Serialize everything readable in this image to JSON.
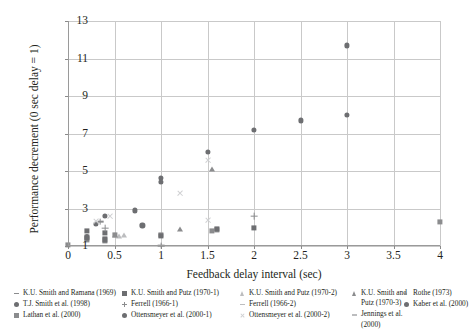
{
  "chart_data": {
    "type": "scatter",
    "title": "",
    "xlabel": "Feedback delay interval (sec)",
    "ylabel": "Performance decrement (0 sec delay = 1)",
    "xlim": [
      0,
      4
    ],
    "ylim": [
      1,
      13
    ],
    "xticks": [
      0,
      0.5,
      1,
      1.5,
      2,
      2.5,
      3,
      3.5,
      4
    ],
    "xticklabels": [
      "0",
      "0.5",
      "1",
      "1.5",
      "2",
      "2.5",
      "3",
      "3.5",
      "4"
    ],
    "yticks": [
      1,
      3,
      5,
      7,
      9,
      11,
      13
    ],
    "yticklabels": [
      "1",
      "3",
      "5",
      "7",
      "9",
      "11",
      "13"
    ],
    "grid": "both",
    "legend_position": "below",
    "colors": {
      "marker_dark": "#6d6e71",
      "marker_mid": "#8b8c8e",
      "marker_light": "#bcbdbf",
      "grid": "#c9c9c9",
      "axis": "#9a9a9a",
      "text": "#231f20"
    },
    "series": [
      {
        "name": "K.U. Smith and Ramana (1969)",
        "marker": "dash",
        "color": "#8b8c8e",
        "points": [
          [
            0.08,
            4.35
          ],
          [
            0.1,
            4.7
          ],
          [
            0.1,
            2.0
          ],
          [
            0.3,
            5.5
          ],
          [
            0.05,
            1.9
          ],
          [
            1.0,
            5.3
          ]
        ]
      },
      {
        "name": "T.J. Smith et al. (1998)",
        "marker": "circle",
        "color": "#6d6e71",
        "points": [
          [
            0.3,
            2.2
          ],
          [
            0.72,
            2.9
          ],
          [
            0.8,
            2.1
          ],
          [
            1.0,
            4.65
          ],
          [
            1.5,
            6.0
          ],
          [
            2.0,
            7.2
          ],
          [
            2.5,
            7.7
          ],
          [
            3.0,
            8.0
          ]
        ]
      },
      {
        "name": "Lathan et al. (2000)",
        "marker": "square",
        "color": "#8b8c8e",
        "points": [
          [
            0.0,
            1.05
          ],
          [
            0.2,
            1.35
          ],
          [
            0.2,
            1.5
          ],
          [
            0.4,
            1.3
          ],
          [
            0.5,
            1.6
          ],
          [
            1.0,
            1.6
          ],
          [
            1.55,
            1.8
          ],
          [
            1.6,
            1.85
          ],
          [
            4.0,
            2.3
          ]
        ]
      },
      {
        "name": "K.U. Smith and Putz (1970-1)",
        "marker": "square",
        "color": "#6d6e71",
        "points": [
          [
            0.2,
            1.45
          ],
          [
            0.2,
            1.8
          ],
          [
            0.4,
            1.35
          ],
          [
            0.4,
            1.7
          ],
          [
            1.0,
            1.55
          ],
          [
            1.6,
            1.9
          ],
          [
            2.0,
            1.95
          ]
        ]
      },
      {
        "name": "Ferrell (1966-1)",
        "marker": "plus",
        "color": "#8b8c8e",
        "points": [
          [
            0.35,
            2.3
          ],
          [
            0.4,
            1.95
          ],
          [
            1.0,
            1.02
          ],
          [
            2.0,
            2.6
          ]
        ]
      },
      {
        "name": "Ottensmeyer et al. (2000-1)",
        "marker": "circle",
        "color": "#6d6e71",
        "points": [
          [
            0.4,
            2.6
          ],
          [
            1.0,
            4.4
          ],
          [
            3.0,
            11.7
          ]
        ]
      },
      {
        "name": "K.U. Smith and Putz (1970-2)",
        "marker": "triangle",
        "color": "#bcbdbf",
        "points": [
          [
            0.6,
            1.6
          ],
          [
            0.55,
            1.55
          ]
        ]
      },
      {
        "name": "Ferrell (1966-2)",
        "marker": "dash",
        "color": "#bcbdbf",
        "points": [
          [
            0.95,
            5.35
          ],
          [
            1.5,
            2.35
          ]
        ]
      },
      {
        "name": "Ottensmeyer et al. (2000-2)",
        "marker": "x",
        "color": "#cfd0d2",
        "points": [
          [
            0.45,
            2.6
          ],
          [
            0.3,
            2.3
          ],
          [
            1.2,
            3.8
          ],
          [
            1.5,
            2.35
          ],
          [
            1.5,
            5.6
          ]
        ]
      },
      {
        "name": "K.U. Smith and Putz (1970-3)",
        "marker": "triangle",
        "color": "#8b8c8e",
        "points": [
          [
            0.5,
            1.6
          ],
          [
            1.2,
            1.9
          ],
          [
            1.55,
            5.1
          ]
        ]
      },
      {
        "name": "Jennings et al. (2000)",
        "marker": "dash",
        "color": "#bcbdbf",
        "points": [
          [
            0.05,
            1.25
          ],
          [
            0.25,
            2.35
          ]
        ]
      },
      {
        "name": "Rothe (1973)",
        "marker": "dot",
        "color": "#8b8c8e",
        "points": [
          [
            0.0,
            1.05
          ]
        ]
      },
      {
        "name": "Kaber et al. (2000)",
        "marker": "circle-small",
        "color": "#6d6e71",
        "points": [
          [
            0.2,
            1.55
          ]
        ]
      }
    ]
  },
  "legend": {
    "columns": [
      {
        "left": 14,
        "width": 108,
        "items": [
          {
            "label": "K.U. Smith and Ramana (1969)",
            "marker": "dash",
            "color": "#8b8c8e"
          },
          {
            "label": "T.J. Smith et al. (1998)",
            "marker": "circle",
            "color": "#6d6e71"
          },
          {
            "label": "Lathan et al. (2000)",
            "marker": "square",
            "color": "#8b8c8e"
          }
        ]
      },
      {
        "left": 122,
        "width": 116,
        "items": [
          {
            "label": "K.U. Smith and Putz (1970-1)",
            "marker": "square",
            "color": "#6d6e71"
          },
          {
            "label": "Ferrell (1966-1)",
            "marker": "plus",
            "color": "#8b8c8e"
          },
          {
            "label": "Ottensmeyer et al. (2000-1)",
            "marker": "circle",
            "color": "#6d6e71"
          }
        ]
      },
      {
        "left": 240,
        "width": 112,
        "items": [
          {
            "label": "K.U. Smith and Putz (1970-2)",
            "marker": "triangle",
            "color": "#bcbdbf"
          },
          {
            "label": "Ferrell (1966-2)",
            "marker": "dash",
            "color": "#bcbdbf"
          },
          {
            "label": "Ottensmeyer et al. (2000-2)",
            "marker": "x",
            "color": "#cfd0d2"
          }
        ]
      },
      {
        "left": 352,
        "width": 62,
        "items": [
          {
            "label": "K.U. Smith and Putz (1970-3)",
            "marker": "triangle",
            "color": "#8b8c8e"
          },
          {
            "label": "Jennings et al. (2000)",
            "marker": "dash",
            "color": "#bcbdbf"
          }
        ]
      },
      {
        "left": 404,
        "width": 70,
        "items": [
          {
            "label": "Rothe (1973)",
            "marker": "dot",
            "color": "#8b8c8e"
          },
          {
            "label": "Kaber et al. (2000)",
            "marker": "circle",
            "color": "#6d6e71"
          }
        ]
      }
    ]
  }
}
